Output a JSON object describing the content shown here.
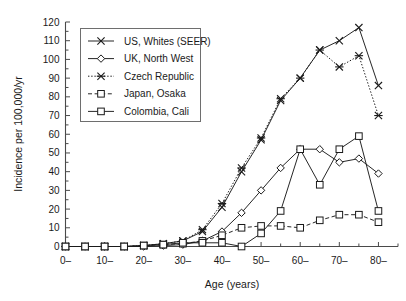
{
  "chart_data": {
    "type": "line",
    "title": "",
    "xlabel": "Age (years)",
    "ylabel": "Incidence per 100,000/yr",
    "xlim": [
      0,
      85
    ],
    "ylim": [
      0,
      120
    ],
    "grid": false,
    "legend_position": "top-left",
    "x_tick_labels": [
      "0–",
      "10–",
      "20–",
      "30–",
      "40–",
      "50–",
      "60–",
      "70–",
      "80–"
    ],
    "x_tick_values": [
      0,
      10,
      20,
      30,
      40,
      50,
      60,
      70,
      80
    ],
    "y_tick_labels": [
      "0",
      "10",
      "20",
      "30",
      "40",
      "50",
      "60",
      "70",
      "80",
      "90",
      "100",
      "110",
      "120"
    ],
    "y_tick_values": [
      0,
      10,
      20,
      30,
      40,
      50,
      60,
      70,
      80,
      90,
      100,
      110,
      120
    ],
    "x": [
      0,
      5,
      10,
      15,
      20,
      25,
      30,
      35,
      40,
      45,
      50,
      55,
      60,
      65,
      70,
      75,
      80
    ],
    "series": [
      {
        "name": "US, Whites (SEER)",
        "marker": "cross",
        "linestyle": "solid",
        "values": [
          0,
          0,
          0,
          0,
          0.5,
          1.5,
          3,
          8,
          21,
          40,
          57,
          78,
          90,
          105,
          110,
          117,
          86
        ]
      },
      {
        "name": "UK, North West",
        "marker": "diamond",
        "linestyle": "solid",
        "values": [
          0,
          0,
          0,
          0,
          0,
          0.5,
          1,
          3,
          8,
          18,
          30,
          42,
          52,
          52,
          45,
          47,
          39
        ]
      },
      {
        "name": "Czech Republic",
        "marker": "star",
        "linestyle": "dotted",
        "values": [
          0,
          0,
          0,
          0,
          0.5,
          1.5,
          3,
          9,
          23,
          42,
          58,
          79,
          90,
          105,
          96,
          102,
          70
        ]
      },
      {
        "name": "Japan, Osaka",
        "marker": "square",
        "linestyle": "dashed",
        "values": [
          0,
          0,
          0,
          0,
          0.5,
          1,
          1.5,
          3,
          6,
          10,
          11,
          11,
          10,
          14,
          17,
          17,
          13
        ]
      },
      {
        "name": "Colombia, Cali",
        "marker": "square",
        "linestyle": "solid",
        "values": [
          0,
          0,
          0,
          0,
          0.5,
          1,
          2,
          2,
          2,
          0,
          7,
          19,
          52,
          33,
          52,
          59,
          19
        ]
      }
    ]
  },
  "axes": {
    "y_title": "Incidence per 100,000/yr",
    "x_title": "Age (years)"
  },
  "legend": {
    "entries": [
      {
        "label": "US, Whites (SEER)"
      },
      {
        "label": "UK, North West"
      },
      {
        "label": "Czech Republic"
      },
      {
        "label": "Japan, Osaka"
      },
      {
        "label": "Colombia, Cali"
      }
    ]
  }
}
